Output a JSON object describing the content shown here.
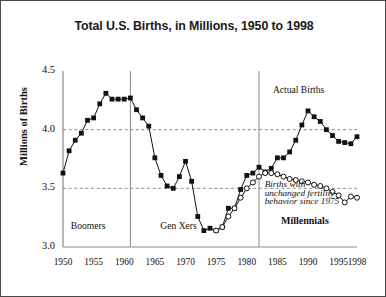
{
  "chart_data": {
    "type": "line",
    "title": "Total U.S. Births, in Millions, 1950 to 1998",
    "xlabel": "",
    "ylabel": "Millions of Births",
    "xlim": [
      1950,
      1998
    ],
    "ylim": [
      3.0,
      4.5
    ],
    "yticks": [
      "3.0",
      "3.5",
      "4.0",
      "4.5"
    ],
    "ytick_values": [
      3.0,
      3.5,
      4.0,
      4.5
    ],
    "xticks": [
      "1950",
      "1955",
      "1960",
      "1965",
      "1970",
      "1975",
      "1980",
      "1985",
      "1990",
      "1995",
      "1998"
    ],
    "xtick_values": [
      1950,
      1955,
      1960,
      1965,
      1970,
      1975,
      1980,
      1985,
      1990,
      1995,
      1998
    ],
    "grid": "horizontal dashed gridlines at 3.5 and 4.0",
    "legend_position": "inline annotations",
    "series": [
      {
        "name": "Actual Births",
        "marker": "filled-square",
        "color": "#111111",
        "x": [
          1950,
          1951,
          1952,
          1953,
          1954,
          1955,
          1956,
          1957,
          1958,
          1959,
          1960,
          1961,
          1962,
          1963,
          1964,
          1965,
          1966,
          1967,
          1968,
          1969,
          1970,
          1971,
          1972,
          1973,
          1974,
          1975,
          1976,
          1977,
          1978,
          1979,
          1980,
          1981,
          1982,
          1983,
          1984,
          1985,
          1986,
          1987,
          1988,
          1989,
          1990,
          1991,
          1992,
          1993,
          1994,
          1995,
          1996,
          1997,
          1998
        ],
        "values": [
          3.63,
          3.82,
          3.91,
          3.97,
          4.08,
          4.1,
          4.22,
          4.31,
          4.26,
          4.26,
          4.26,
          4.27,
          4.17,
          4.1,
          4.03,
          3.76,
          3.61,
          3.52,
          3.5,
          3.6,
          3.73,
          3.56,
          3.26,
          3.14,
          3.16,
          3.14,
          3.17,
          3.33,
          3.33,
          3.49,
          3.61,
          3.63,
          3.68,
          3.64,
          3.67,
          3.76,
          3.76,
          3.81,
          3.91,
          4.04,
          4.16,
          4.11,
          4.07,
          4.0,
          3.95,
          3.9,
          3.89,
          3.88,
          3.94
        ]
      },
      {
        "name": "Births with unchanged fertility behavior since 1975",
        "marker": "open-circle",
        "color": "#111111",
        "x": [
          1975,
          1976,
          1977,
          1978,
          1979,
          1980,
          1981,
          1982,
          1983,
          1984,
          1985,
          1986,
          1987,
          1988,
          1989,
          1990,
          1991,
          1992,
          1993,
          1994,
          1995,
          1996,
          1997,
          1998
        ],
        "values": [
          3.14,
          3.17,
          3.26,
          3.33,
          3.42,
          3.5,
          3.55,
          3.6,
          3.63,
          3.63,
          3.62,
          3.6,
          3.58,
          3.57,
          3.56,
          3.55,
          3.53,
          3.52,
          3.5,
          3.47,
          3.44,
          3.38,
          3.43,
          3.42
        ]
      }
    ],
    "annotations": [
      {
        "text": "Actual Births",
        "x": 1989,
        "y": 4.32,
        "style": "plain"
      },
      {
        "text": "Births with",
        "x": 1983,
        "y": 3.52,
        "style": "italic"
      },
      {
        "text": "unchanged fertility",
        "x": 1983,
        "y": 3.45,
        "style": "italic"
      },
      {
        "text": "behavior since 1975",
        "x": 1983,
        "y": 3.38,
        "style": "italic"
      },
      {
        "text": "Boomers",
        "x": 1955,
        "y": 3.16,
        "style": "plain"
      },
      {
        "text": "Gen Xers",
        "x": 1970,
        "y": 3.16,
        "style": "plain"
      },
      {
        "text": "Millennials",
        "x": 1990,
        "y": 3.22,
        "style": "bold"
      }
    ],
    "dividers": [
      1961,
      1982
    ],
    "divider_note": "vertical generation boundary lines"
  },
  "labels": {
    "boomers": "Boomers",
    "gen_xers": "Gen Xers",
    "millennials": "Millennials",
    "actual_births": "Actual Births",
    "annot_line1": "Births with",
    "annot_line2": "unchanged fertility",
    "annot_line3": "behavior since 1975"
  }
}
